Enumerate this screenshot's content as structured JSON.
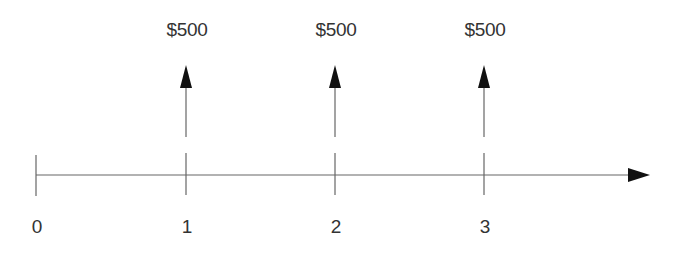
{
  "diagram": {
    "type": "cash-flow-timeline",
    "timeline": {
      "periods": [
        {
          "label": "0",
          "x": 36
        },
        {
          "label": "1",
          "x": 186
        },
        {
          "label": "2",
          "x": 335
        },
        {
          "label": "3",
          "x": 484
        }
      ],
      "axis_end_x": 650,
      "axis_y": 175
    },
    "cash_flows": [
      {
        "period": "1",
        "amount": "$500",
        "direction": "up",
        "x": 186
      },
      {
        "period": "2",
        "amount": "$500",
        "direction": "up",
        "x": 335
      },
      {
        "period": "3",
        "amount": "$500",
        "direction": "up",
        "x": 484
      }
    ],
    "colors": {
      "line": "#555555",
      "arrowhead": "#111111",
      "text": "#333333"
    }
  }
}
